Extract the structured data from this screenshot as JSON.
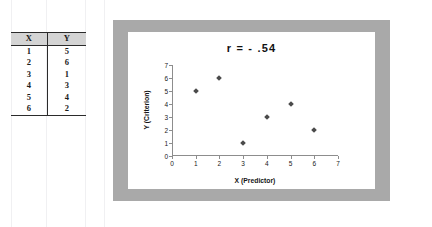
{
  "table": {
    "headers": [
      "X",
      "Y"
    ],
    "rows": [
      [
        "1",
        "5"
      ],
      [
        "2",
        "6"
      ],
      [
        "3",
        "1"
      ],
      [
        "4",
        "3"
      ],
      [
        "5",
        "4"
      ],
      [
        "6",
        "2"
      ]
    ]
  },
  "chart_data": {
    "type": "scatter",
    "title": "r  =  - .54",
    "xlabel": "X (Predictor)",
    "ylabel": "Y (Criterion)",
    "xlim": [
      0,
      7
    ],
    "ylim": [
      0,
      7
    ],
    "xticks": [
      "0",
      "1",
      "2",
      "3",
      "4",
      "5",
      "6",
      "7"
    ],
    "yticks": [
      "0",
      "1",
      "2",
      "3",
      "4",
      "5",
      "6",
      "7"
    ],
    "grid": false,
    "legend": false,
    "marker_color": "#4b4b4b",
    "marker_shape": "diamond",
    "series": [
      {
        "name": "observations",
        "x": [
          1,
          2,
          3,
          4,
          5,
          6
        ],
        "y": [
          5,
          6,
          1,
          3,
          4,
          2
        ]
      }
    ]
  },
  "colors": {
    "frame": "#a9a9a9",
    "panel": "#ffffff",
    "axis": "#8d8d8d",
    "table_header_bg": "#d4d4d4"
  }
}
